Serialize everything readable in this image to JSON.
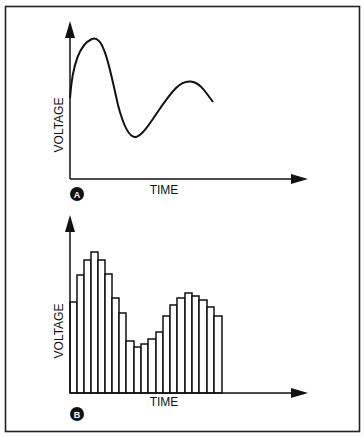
{
  "figure": {
    "border_color": "#222222",
    "panels": [
      {
        "label": "A",
        "kind": "continuous waveform",
        "ylabel": "VOLTAGE",
        "xlabel": "TIME",
        "curve_points": [
          [
            70,
            98
          ],
          [
            74,
            70
          ],
          [
            80,
            50
          ],
          [
            86,
            40
          ],
          [
            92,
            39
          ],
          [
            98,
            44
          ],
          [
            104,
            58
          ],
          [
            110,
            80
          ],
          [
            116,
            104
          ],
          [
            122,
            124
          ],
          [
            128,
            134
          ],
          [
            134,
            137
          ],
          [
            140,
            134
          ],
          [
            148,
            124
          ],
          [
            158,
            108
          ],
          [
            168,
            94
          ],
          [
            178,
            85
          ],
          [
            188,
            81
          ],
          [
            196,
            83
          ],
          [
            204,
            91
          ],
          [
            212,
            102
          ]
        ]
      },
      {
        "label": "B",
        "kind": "sampled waveform (bars)",
        "ylabel": "VOLTAGE",
        "xlabel": "TIME",
        "baseline_y": 393,
        "bar_edges": [
          70,
          77,
          84,
          91,
          98,
          105,
          112,
          119,
          126,
          134,
          141,
          148,
          156,
          163,
          170,
          177,
          185,
          192,
          199,
          207,
          214,
          222
        ],
        "bar_tops": [
          302,
          275,
          260,
          252,
          260,
          274,
          298,
          313,
          341,
          347,
          344,
          339,
          332,
          316,
          305,
          298,
          293,
          296,
          300,
          307,
          316
        ]
      }
    ]
  },
  "chart_data": [
    {
      "type": "line",
      "title": "A",
      "xlabel": "TIME",
      "ylabel": "VOLTAGE",
      "grid": false,
      "description": "Damped oscillation starting at mid level, rising to a high peak, falling to a trough, then rising to a smaller second peak and descending",
      "x": [
        0,
        1,
        2,
        3,
        4,
        5,
        6,
        7,
        8,
        9,
        10
      ],
      "values": [
        58,
        100,
        72,
        20,
        5,
        20,
        45,
        62,
        67,
        60,
        55
      ]
    },
    {
      "type": "bar",
      "title": "B",
      "xlabel": "TIME",
      "ylabel": "VOLTAGE",
      "grid": false,
      "description": "Same waveform sampled as 21 adjacent bars",
      "categories": [
        "1",
        "2",
        "3",
        "4",
        "5",
        "6",
        "7",
        "8",
        "9",
        "10",
        "11",
        "12",
        "13",
        "14",
        "15",
        "16",
        "17",
        "18",
        "19",
        "20",
        "21"
      ],
      "values": [
        64,
        84,
        94,
        100,
        94,
        84,
        67,
        56,
        36,
        32,
        34,
        38,
        43,
        54,
        62,
        67,
        71,
        69,
        66,
        61,
        54
      ]
    }
  ]
}
